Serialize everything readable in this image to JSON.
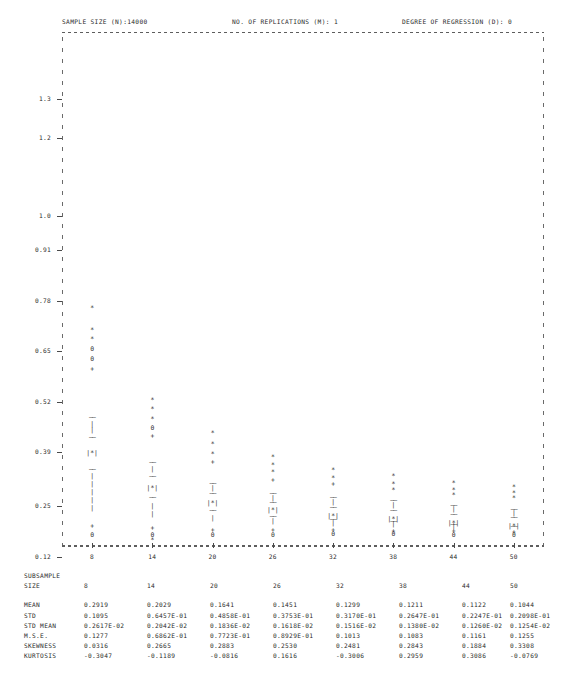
{
  "header": {
    "sample_size": "SAMPLE SIZE (N):14000",
    "replications": "NO. OF REPLICATIONS (M):   1",
    "degree": "DEGREE OF REGRESSION (D):  0"
  },
  "axes": {
    "y_ticks": [
      "1.3",
      "1.2",
      "1.0",
      "0.91",
      "0.78",
      "0.65",
      "0.52",
      "0.39",
      "0.25",
      "0.12"
    ],
    "x_ticks": [
      "8",
      "14",
      "20",
      "26",
      "32",
      "38",
      "44",
      "50"
    ]
  },
  "table": {
    "title_line1": "SUBSAMPLE",
    "title_line2": "SIZE",
    "columns": [
      "8",
      "14",
      "20",
      "26",
      "32",
      "38",
      "44",
      "50"
    ],
    "rows": [
      {
        "label": "MEAN",
        "values": [
          "0.2919",
          "0.2029",
          "0.1641",
          "0.1451",
          "0.1299",
          "0.1211",
          "0.1122",
          "0.1044"
        ]
      },
      {
        "label": "STD",
        "values": [
          "0.1095",
          "0.6457E-01",
          "0.4858E-01",
          "0.3753E-01",
          "0.3170E-01",
          "0.2647E-01",
          "0.2247E-01",
          "0.2098E-01"
        ]
      },
      {
        "label": "STD MEAN",
        "values": [
          "0.2617E-02",
          "0.2042E-02",
          "0.1836E-02",
          "0.1618E-02",
          "0.1516E-02",
          "0.1380E-02",
          "0.1260E-02",
          "0.1254E-02"
        ]
      },
      {
        "label": "M.S.E.",
        "values": [
          "0.1277",
          "0.6862E-01",
          "0.7723E-01",
          "0.8929E-01",
          "0.1013",
          "0.1083",
          "0.1161",
          "0.1255"
        ]
      },
      {
        "label": "SKEWNESS",
        "values": [
          "0.0316",
          "0.2665",
          "0.2883",
          "0.2530",
          "0.2481",
          "0.2843",
          "0.1884",
          "0.3308"
        ]
      },
      {
        "label": "KURTOSIS",
        "values": [
          "-0.3047",
          "-0.1189",
          "-0.0816",
          "0.1616",
          "-0.3006",
          "0.2959",
          "0.3086",
          "-0.0769"
        ]
      }
    ]
  },
  "chart_data": {
    "type": "box",
    "title": "",
    "xlabel": "SUBSAMPLE SIZE",
    "ylabel": "",
    "ylim": [
      0.055,
      1.365
    ],
    "xlim": [
      5,
      53
    ],
    "grid": false,
    "legend": "none",
    "y_tick_values": [
      1.3,
      1.2,
      1.0,
      0.91,
      0.78,
      0.65,
      0.52,
      0.39,
      0.25,
      0.12
    ],
    "x_tick_values": [
      8,
      14,
      20,
      26,
      32,
      38,
      44,
      50
    ],
    "marker_legend": {
      "asterisk": "outlier / extreme value",
      "zero": "minimum or low marker",
      "plus": "percentile marker",
      "dash_row": "box hinge (quartile)",
      "bar": "whisker line",
      "boxed_asterisk": "median inside box"
    },
    "boxes": [
      {
        "size": 8,
        "upper_points": [
          0.665,
          0.61,
          0.585
        ],
        "zeros_upper": [
          0.56,
          0.535
        ],
        "plus_upper": 0.51,
        "whisker_top": 0.385,
        "box_top": 0.333,
        "median": 0.292,
        "box_bottom": 0.252,
        "whisker_bottom": 0.13,
        "plus_lower": 0.103,
        "zero_lower": 0.082,
        "star_lower": null
      },
      {
        "size": 14,
        "upper_points": [
          0.43,
          0.405,
          0.38
        ],
        "zeros_upper": [
          0.358
        ],
        "plus_upper": 0.335,
        "whisker_top": 0.268,
        "box_top": 0.232,
        "median": 0.203,
        "box_bottom": 0.178,
        "whisker_bottom": 0.112,
        "plus_lower": 0.098,
        "zero_lower": 0.082,
        "star_lower": 0.068
      },
      {
        "size": 20,
        "upper_points": [
          0.345,
          0.315,
          0.29
        ],
        "zeros_upper": [],
        "plus_upper": 0.268,
        "whisker_top": 0.215,
        "box_top": 0.188,
        "median": 0.164,
        "box_bottom": 0.145,
        "whisker_bottom": 0.106,
        "plus_lower": 0.094,
        "zero_lower": 0.08,
        "star_lower": null
      },
      {
        "size": 26,
        "upper_points": [
          0.283,
          0.262,
          0.243
        ],
        "zeros_upper": [],
        "plus_upper": 0.222,
        "whisker_top": 0.188,
        "box_top": 0.165,
        "median": 0.145,
        "box_bottom": 0.13,
        "whisker_bottom": 0.103,
        "plus_lower": 0.093,
        "zero_lower": 0.082,
        "star_lower": null
      },
      {
        "size": 32,
        "upper_points": [
          0.248,
          0.228
        ],
        "zeros_upper": [],
        "plus_upper": 0.212,
        "whisker_top": 0.18,
        "box_top": 0.152,
        "median": 0.13,
        "box_bottom": 0.122,
        "whisker_bottom": 0.102,
        "plus_lower": 0.094,
        "zero_lower": 0.084,
        "star_lower": null
      },
      {
        "size": 38,
        "upper_points": [
          0.232,
          0.212,
          0.196
        ],
        "zeros_upper": [],
        "plus_upper": null,
        "whisker_top": 0.17,
        "box_top": 0.146,
        "median": 0.121,
        "box_bottom": 0.118,
        "whisker_bottom": 0.1,
        "plus_lower": 0.092,
        "zero_lower": 0.083,
        "star_lower": null
      },
      {
        "size": 44,
        "upper_points": [
          0.216,
          0.198,
          0.184
        ],
        "zeros_upper": [],
        "plus_upper": null,
        "whisker_top": 0.158,
        "box_top": 0.136,
        "median": 0.112,
        "box_bottom": 0.11,
        "whisker_bottom": 0.096,
        "plus_lower": 0.09,
        "zero_lower": 0.082,
        "star_lower": null
      },
      {
        "size": 50,
        "upper_points": [
          0.205,
          0.19,
          0.176
        ],
        "zeros_upper": [],
        "plus_upper": null,
        "whisker_top": 0.148,
        "box_top": 0.128,
        "median": 0.104,
        "box_bottom": 0.103,
        "whisker_bottom": 0.092,
        "plus_lower": 0.088,
        "zero_lower": 0.08,
        "star_lower": null
      }
    ]
  }
}
